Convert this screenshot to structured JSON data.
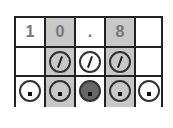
{
  "answer_grid": {
    "entered_answer": "10.8",
    "columns": [
      {
        "index": 0,
        "char": "1",
        "shaded": false,
        "slash_bubble": false,
        "dot_bubble": {
          "present": true,
          "filled": false
        }
      },
      {
        "index": 1,
        "char": "0",
        "shaded": true,
        "slash_bubble": true,
        "dot_bubble": {
          "present": true,
          "filled": false
        }
      },
      {
        "index": 2,
        "char": ".",
        "shaded": false,
        "slash_bubble": true,
        "dot_bubble": {
          "present": true,
          "filled": true
        }
      },
      {
        "index": 3,
        "char": "8",
        "shaded": true,
        "slash_bubble": true,
        "dot_bubble": {
          "present": true,
          "filled": false
        }
      },
      {
        "index": 4,
        "char": "",
        "shaded": false,
        "slash_bubble": false,
        "dot_bubble": {
          "present": true,
          "filled": false
        }
      }
    ],
    "colors": {
      "line": "#222222",
      "shade": "#c8c8c8",
      "filled_bubble": "#666666",
      "digit": "#777777"
    }
  }
}
